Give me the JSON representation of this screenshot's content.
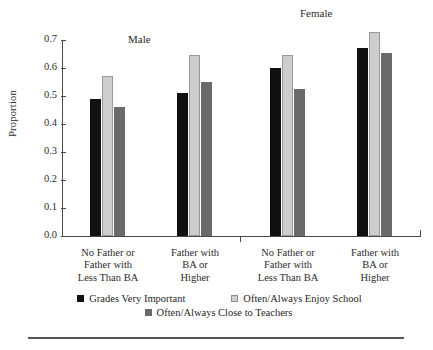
{
  "chart_data": {
    "type": "bar",
    "title": "",
    "xlabel": "",
    "ylabel": "Proportion",
    "ylim": [
      0.0,
      0.7
    ],
    "ytick_labels": [
      "0.0",
      "0.1",
      "0.2",
      "0.3",
      "0.4",
      "0.5",
      "0.6",
      "0.7"
    ],
    "ytick_values": [
      0.0,
      0.1,
      0.2,
      0.3,
      0.4,
      0.5,
      0.6,
      0.7
    ],
    "grid": false,
    "legend_position": "bottom",
    "panels": [
      {
        "name": "Male",
        "label": "Male"
      },
      {
        "name": "Female",
        "label": "Female"
      }
    ],
    "categories": [
      "No Father or Father with Less Than BA",
      "Father with BA or Higher",
      "No Father or Father with Less Than BA",
      "Father with BA or Higher"
    ],
    "category_lines": [
      [
        "No Father or",
        "Father with",
        "Less Than BA"
      ],
      [
        "Father with",
        "BA or",
        "Higher"
      ],
      [
        "No Father or",
        "Father with",
        "Less Than BA"
      ],
      [
        "Father with",
        "BA or",
        "Higher"
      ]
    ],
    "series": [
      {
        "name": "Grades Very Important",
        "color": "#111111",
        "values": [
          0.49,
          0.51,
          0.6,
          0.67
        ]
      },
      {
        "name": "Often/Always Enjoy School",
        "color": "#cdcdcd",
        "values": [
          0.57,
          0.645,
          0.645,
          0.73
        ]
      },
      {
        "name": "Often/Always Close to Teachers",
        "color": "#6a6a6a",
        "values": [
          0.46,
          0.55,
          0.525,
          0.655
        ]
      }
    ]
  },
  "legend": {
    "items": [
      {
        "label": "Grades Very Important"
      },
      {
        "label": "Often/Always Enjoy School"
      },
      {
        "label": "Often/Always Close to Teachers"
      }
    ]
  }
}
